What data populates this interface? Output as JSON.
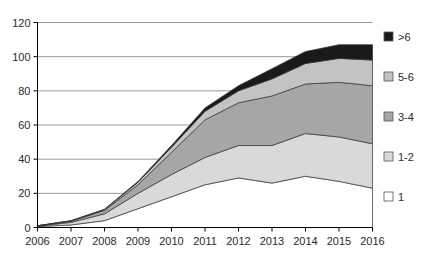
{
  "chart_data": {
    "type": "area",
    "stacked": true,
    "title": "",
    "xlabel": "",
    "ylabel": "",
    "grid": true,
    "legend_position": "right",
    "xlim": [
      2006,
      2016
    ],
    "ylim": [
      0,
      120
    ],
    "ytick_labels": [
      "0",
      "20",
      "40",
      "60",
      "80",
      "100",
      "120"
    ],
    "yticks": [
      0,
      20,
      40,
      60,
      80,
      100,
      120
    ],
    "categories": [
      2006,
      2007,
      2008,
      2009,
      2010,
      2011,
      2012,
      2013,
      2014,
      2015,
      2016
    ],
    "xtick_labels": [
      "2006",
      "2007",
      "2008",
      "2009",
      "2010",
      "2011",
      "2012",
      "2013",
      "2014",
      "2015",
      "2016"
    ],
    "series": [
      {
        "name": "1",
        "color": "#ffffff",
        "values": [
          0.5,
          1.5,
          4,
          11,
          18,
          25,
          29,
          26,
          30,
          27,
          23
        ]
      },
      {
        "name": "1-2",
        "color": "#d9d9d9",
        "values": [
          0.3,
          1.5,
          4,
          9,
          13,
          16,
          19,
          22,
          25,
          26,
          26
        ]
      },
      {
        "name": "3-4",
        "color": "#a6a6a6",
        "values": [
          0.2,
          0.7,
          2,
          5,
          13,
          22,
          25,
          29,
          29,
          32,
          34
        ]
      },
      {
        "name": "5-6",
        "color": "#c3c3c3",
        "values": [
          0,
          0.2,
          0.5,
          1.5,
          3,
          5,
          7,
          10,
          12,
          14,
          15
        ]
      },
      {
        "name": ">6",
        "color": "#1a1a1a",
        "values": [
          0,
          0.1,
          0.2,
          0.5,
          1,
          2,
          3,
          6,
          7,
          8,
          9
        ]
      }
    ],
    "legend_entries": [
      {
        "label": ">6",
        "color": "#1a1a1a"
      },
      {
        "label": "5-6",
        "color": "#c3c3c3"
      },
      {
        "label": "3-4",
        "color": "#a6a6a6"
      },
      {
        "label": "1-2",
        "color": "#d9d9d9"
      },
      {
        "label": "1",
        "color": "#ffffff"
      }
    ],
    "colors": {
      "axis": "#000000",
      "gridline": "#9a9a9a",
      "outline": "#333333",
      "text": "#2b2b2b"
    }
  }
}
